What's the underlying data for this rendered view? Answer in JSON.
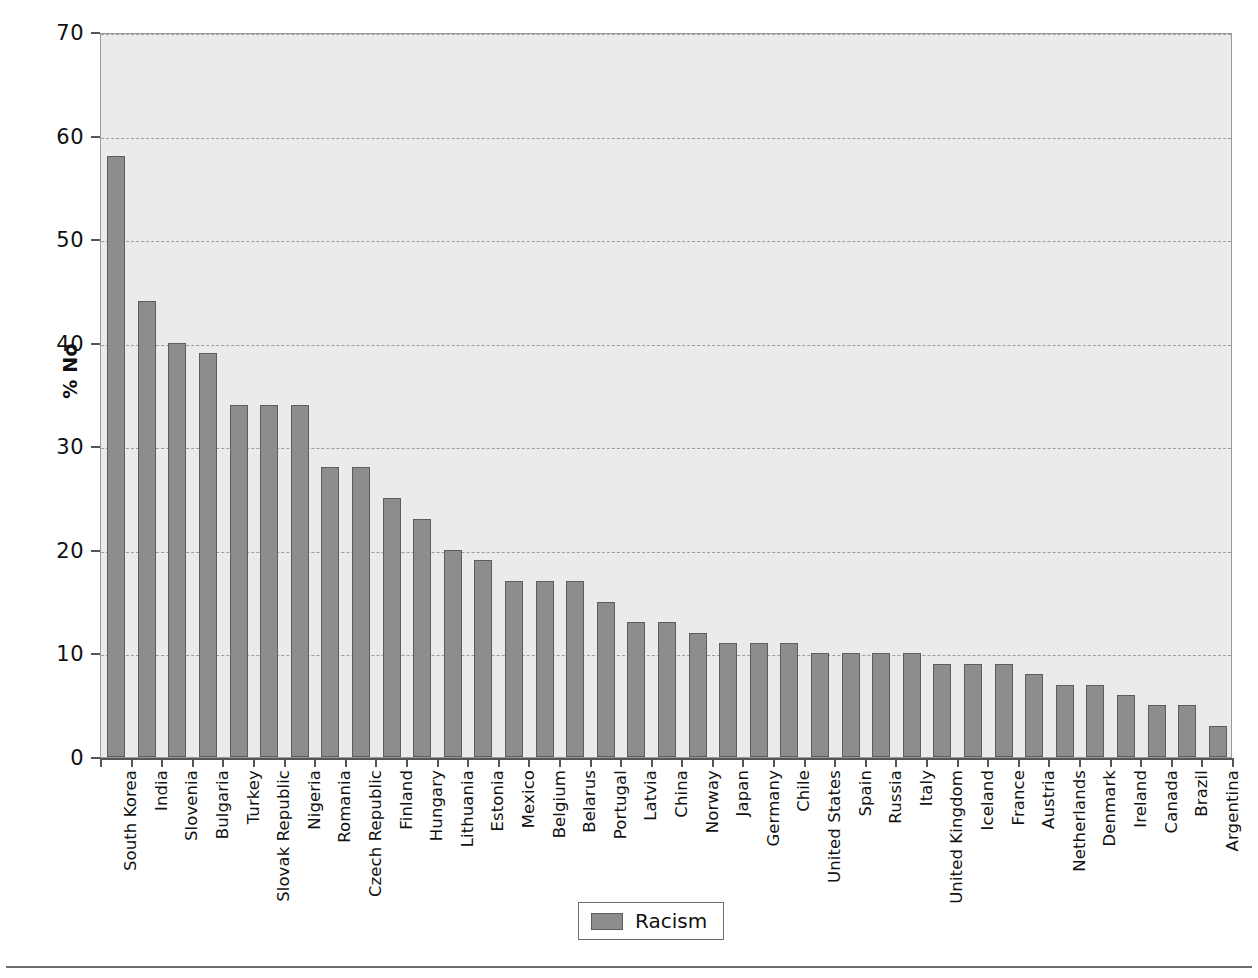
{
  "chart_data": {
    "type": "bar",
    "title": "",
    "xlabel": "",
    "ylabel": "% No",
    "ylim": [
      0,
      70
    ],
    "yticks": [
      0,
      10,
      20,
      30,
      40,
      50,
      60,
      70
    ],
    "grid": true,
    "legend_position": "bottom-center",
    "series_name": "Racism",
    "series_color": "#8d8d8d",
    "categories": [
      "South Korea",
      "India",
      "Slovenia",
      "Bulgaria",
      "Turkey",
      "Slovak Republic",
      "Nigeria",
      "Romania",
      "Czech Republic",
      "Finland",
      "Hungary",
      "Lithuania",
      "Estonia",
      "Mexico",
      "Belgium",
      "Belarus",
      "Portugal",
      "Latvia",
      "China",
      "Norway",
      "Japan",
      "Germany",
      "Chile",
      "United States",
      "Spain",
      "Russia",
      "Italy",
      "United Kingdom",
      "Iceland",
      "France",
      "Austria",
      "Netherlands",
      "Denmark",
      "Ireland",
      "Canada",
      "Brazil",
      "Argentina"
    ],
    "values": [
      58,
      44,
      40,
      39,
      34,
      34,
      34,
      28,
      28,
      25,
      23,
      20,
      19,
      17,
      17,
      17,
      15,
      13,
      13,
      12,
      11,
      11,
      11,
      10,
      10,
      10,
      10,
      9,
      9,
      9,
      8,
      7,
      7,
      6,
      5,
      5,
      3
    ],
    "series": [
      {
        "name": "Racism",
        "values": [
          58,
          44,
          40,
          39,
          34,
          34,
          34,
          28,
          28,
          25,
          23,
          20,
          19,
          17,
          17,
          17,
          15,
          13,
          13,
          12,
          11,
          11,
          11,
          10,
          10,
          10,
          10,
          9,
          9,
          9,
          8,
          7,
          7,
          6,
          5,
          5,
          3
        ]
      }
    ]
  },
  "legend": {
    "items": [
      {
        "label": "Racism",
        "color": "#8d8d8d"
      }
    ]
  },
  "axes": {
    "y_title": "% No",
    "y_tick_labels": [
      "0",
      "10",
      "20",
      "30",
      "40",
      "50",
      "60",
      "70"
    ]
  },
  "colors": {
    "bar_fill": "#8d8d8d",
    "bar_stroke": "#5d5d5d",
    "plot_background": "#ebebeb",
    "gridline": "#9d9d9d",
    "axis": "#555555",
    "text": "#111111"
  }
}
